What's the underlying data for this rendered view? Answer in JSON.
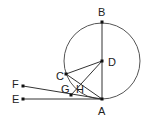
{
  "diagram": {
    "type": "geometry",
    "circle": {
      "center": "D",
      "cx": 102,
      "cy": 61,
      "r": 38
    },
    "points": {
      "A": {
        "label": "A",
        "x": 102,
        "y": 99
      },
      "B": {
        "label": "B",
        "x": 102,
        "y": 22
      },
      "C": {
        "label": "C",
        "x": 66,
        "y": 74
      },
      "D": {
        "label": "D",
        "x": 102,
        "y": 61
      },
      "E": {
        "label": "E",
        "x": 23,
        "y": 99
      },
      "F": {
        "label": "F",
        "x": 23,
        "y": 86
      },
      "G": {
        "label": "G",
        "x": 71,
        "y": 95
      },
      "H": {
        "label": "H",
        "x": 82,
        "y": 84
      }
    },
    "segments": [
      [
        "B",
        "A"
      ],
      [
        "C",
        "D"
      ],
      [
        "C",
        "A"
      ],
      [
        "D",
        "G"
      ],
      [
        "F",
        "A"
      ],
      [
        "E",
        "A"
      ]
    ],
    "colors": {
      "stroke": "#333333",
      "circle": "#555555",
      "point": "#111111"
    }
  }
}
